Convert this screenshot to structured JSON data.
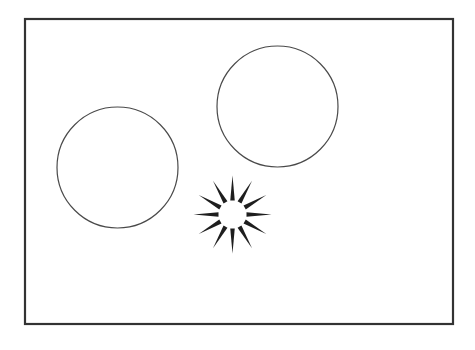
{
  "canvas": {
    "width": 475,
    "height": 350,
    "background": "#ffffff"
  },
  "frame": {
    "x": 25,
    "y": 19,
    "width": 428,
    "height": 305,
    "stroke": "#333333",
    "stroke_width": 2.2
  },
  "circles": [
    {
      "name": "left-circle",
      "cx": 117.5,
      "cy": 167.5,
      "r": 60.5,
      "stroke": "#4a4a4a",
      "stroke_width": 1.2
    },
    {
      "name": "right-circle",
      "cx": 277.5,
      "cy": 106.5,
      "r": 60.5,
      "stroke": "#4a4a4a",
      "stroke_width": 1.2
    }
  ],
  "starburst": {
    "cx": 232.5,
    "cy": 214.5,
    "ray_count": 12,
    "inner_radius": 13,
    "ray_base_radius": 14,
    "ray_tip_radius": 39,
    "ray_base_width": 4.5,
    "start_angle_deg": 0,
    "color": "#1e1e1e"
  }
}
